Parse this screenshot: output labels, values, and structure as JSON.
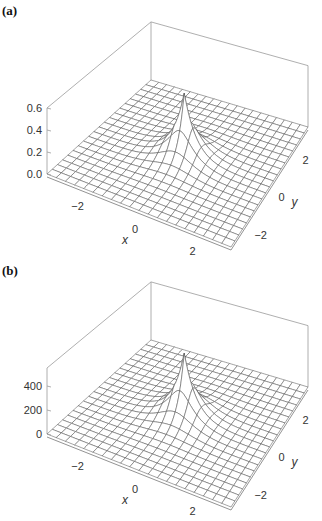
{
  "chart_data": [
    {
      "panel_label": "(a)",
      "type": "surface3d",
      "title": "",
      "xlabel": "x",
      "ylabel": "y",
      "zlabel": "",
      "x_ticks": [
        "-2",
        "0",
        "2"
      ],
      "y_ticks": [
        "-2",
        "0",
        "2"
      ],
      "z_ticks": [
        "0.0",
        "0.2",
        "0.4",
        "0.6"
      ],
      "xlim": [
        -3.2,
        3.2
      ],
      "ylim": [
        -3.2,
        3.2
      ],
      "zlim": [
        0,
        0.6
      ],
      "surface": "sharply peaked cusp at origin, decaying toward zero",
      "peak": {
        "x": 0,
        "y": 0,
        "z": 0.6
      },
      "grid": "mesh 20x20",
      "box": true
    },
    {
      "panel_label": "(b)",
      "type": "surface3d",
      "title": "",
      "xlabel": "x",
      "ylabel": "y",
      "zlabel": "",
      "x_ticks": [
        "-2",
        "0",
        "2"
      ],
      "y_ticks": [
        "-2",
        "0",
        "2"
      ],
      "z_ticks": [
        "0",
        "200",
        "400"
      ],
      "xlim": [
        -3.2,
        3.2
      ],
      "ylim": [
        -3.2,
        3.2
      ],
      "zlim": [
        0,
        550
      ],
      "surface": "sharply peaked cusp at origin, decaying toward zero",
      "peak": {
        "x": 0,
        "y": 0,
        "z": 550
      },
      "grid": "mesh 20x20",
      "box": true
    }
  ]
}
